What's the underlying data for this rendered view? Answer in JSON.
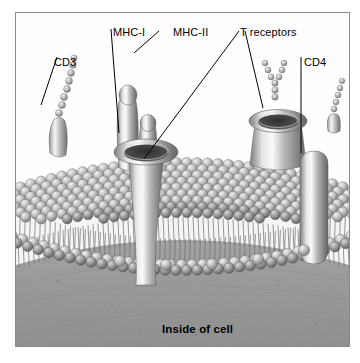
{
  "figure": {
    "title_alt": "T cell plasma membrane with surface receptor proteins",
    "border_color": "#8a8a8a",
    "background": "#ffffff"
  },
  "labels": {
    "cd3": "CD3",
    "mhc_i": "MHC-I",
    "mhc_ii": "MHC-II",
    "t_receptors": "T receptors",
    "cd4": "CD4",
    "inside_of_cell": "Inside of cell"
  },
  "diagram": {
    "type": "labeled-biological-illustration",
    "membrane": {
      "name": "phospholipid bilayer",
      "leaflets": 2,
      "outer_leaflet": "spherical head groups, densely packed dome",
      "inner_leaflet": "spherical head groups, single row",
      "tails": "hair-like fatty acid tails between leaflets",
      "head_color": "#b9b9b9",
      "tail_color": "#6f6f6f",
      "cytoplasm_color": "#9a9a9a"
    },
    "structures": [
      {
        "name": "CD3",
        "shape": "beaded-chain-on-stalk",
        "side": "left"
      },
      {
        "name": "MHC-I",
        "shape": "short-knob-cylinder",
        "side": "center-left"
      },
      {
        "name": "MHC-II",
        "shape": "tall-knob-cylinder",
        "side": "center-left"
      },
      {
        "name": "T receptor",
        "shape": "funnel-channel",
        "side": "center"
      },
      {
        "name": "T receptor",
        "shape": "conical-cup",
        "side": "center-right"
      },
      {
        "name": "Y-receptor",
        "shape": "beaded-Y",
        "side": "right"
      },
      {
        "name": "CD4",
        "shape": "elongated-capsule",
        "side": "right"
      }
    ],
    "leader_lines": [
      {
        "label": "CD3",
        "from": [
          56,
          56
        ],
        "to": [
          40,
          104
        ]
      },
      {
        "label": "MHC-I",
        "from": [
          110,
          28
        ],
        "to": [
          118,
          132
        ]
      },
      {
        "label": "MHC-II",
        "from": [
          158,
          30
        ],
        "to": [
          133,
          52
        ]
      },
      {
        "label": "T receptors",
        "from": [
          238,
          30
        ],
        "to": [
          143,
          158
        ]
      },
      {
        "label": "T receptors",
        "from": [
          244,
          30
        ],
        "to": [
          262,
          107
        ]
      },
      {
        "label": "CD4",
        "from": [
          300,
          56
        ],
        "to": [
          300,
          152
        ]
      }
    ]
  }
}
